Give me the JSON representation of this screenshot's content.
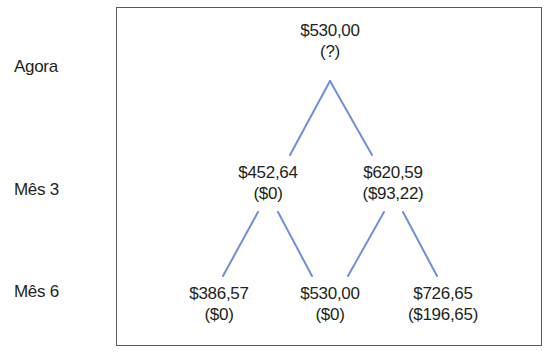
{
  "row_labels": {
    "now": "Agora",
    "month3": "Mês 3",
    "month6": "Mês 6"
  },
  "line_color": "#6f8fd8",
  "nodes": {
    "root": {
      "price": "$530,00",
      "payoff": "(?)"
    },
    "m3_down": {
      "price": "$452,64",
      "payoff": "($0)"
    },
    "m3_up": {
      "price": "$620,59",
      "payoff": "($93,22)"
    },
    "m6_downdown": {
      "price": "$386,57",
      "payoff": "($0)"
    },
    "m6_mid": {
      "price": "$530,00",
      "payoff": "($0)"
    },
    "m6_upup": {
      "price": "$726,65",
      "payoff": "($196,65)"
    }
  }
}
